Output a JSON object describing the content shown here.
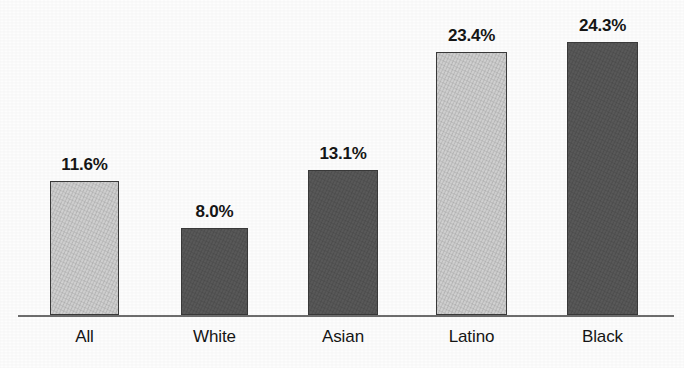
{
  "chart_data": {
    "type": "bar",
    "title": "",
    "subtitle": "",
    "xlabel": "",
    "ylabel": "",
    "categories": [
      "All",
      "White",
      "Asian",
      "Latino",
      "Black"
    ],
    "values": [
      11.6,
      8.0,
      13.1,
      23.4,
      24.3
    ],
    "value_labels": [
      "11.6%",
      "8.0%",
      "13.1%",
      "23.4%",
      "24.3%"
    ],
    "ylim": [
      0,
      26.5
    ],
    "grid": false,
    "legend": "none",
    "series": [
      {
        "name": "Percent",
        "values": [
          11.6,
          8.0,
          13.1,
          23.4,
          24.3
        ]
      }
    ],
    "bar_fills": [
      "light-gray",
      "dark-gray",
      "dark-gray",
      "light-gray",
      "dark-gray"
    ],
    "annotations": []
  },
  "style": {
    "background": "#fdfdfd",
    "light_bar_color": "#d2d2d2",
    "dark_bar_color": "#5a5a5a",
    "bar_border_color": "#3a3a3a",
    "axis_color": "#6d6d6d",
    "text_color": "#161616"
  },
  "bars": [
    {
      "category": "All",
      "value_label": "11.6%",
      "fill": "light-gray",
      "x": 50,
      "width": 69,
      "top": 181
    },
    {
      "category": "White",
      "value_label": "8.0%",
      "fill": "dark-gray",
      "x": 181,
      "width": 67,
      "top": 228
    },
    {
      "category": "Asian",
      "value_label": "13.1%",
      "fill": "dark-gray",
      "x": 308,
      "width": 70,
      "top": 170
    },
    {
      "category": "Latino",
      "value_label": "23.4%",
      "fill": "light-gray",
      "x": 436,
      "width": 71,
      "top": 52
    },
    {
      "category": "Black",
      "value_label": "24.3%",
      "fill": "dark-gray",
      "x": 567,
      "width": 71,
      "top": 42
    }
  ],
  "axis": {
    "baseline_y": 315
  }
}
